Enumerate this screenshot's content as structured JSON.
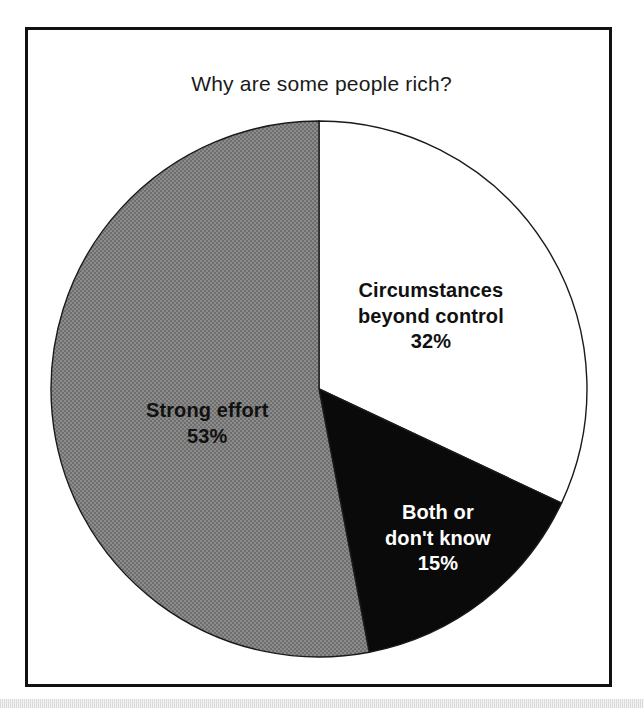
{
  "figure": {
    "title": "Why are some people rich?"
  },
  "chart_data": {
    "type": "pie",
    "title": "Why are some people rich?",
    "xlabel": "",
    "ylabel": "",
    "unit": "%",
    "start_angle_deg": 0,
    "direction": "clockwise",
    "legend": "none",
    "grid": false,
    "categories": [
      "Circumstances beyond control",
      "Both or don't know",
      "Strong effort"
    ],
    "values": [
      32,
      15,
      53
    ],
    "slices": [
      {
        "label": "Circumstances beyond control",
        "label_line_1": "Circumstances",
        "label_line_2": "beyond control",
        "value": 32,
        "value_label": "32%",
        "color": "#ffffff",
        "text_color": "#111111",
        "start_angle_deg": 0,
        "end_angle_deg": 115.2
      },
      {
        "label": "Both or don't know",
        "label_line_1": "Both or",
        "label_line_2": "don't know",
        "value": 15,
        "value_label": "15%",
        "color": "#0a0a0a",
        "text_color": "#ffffff",
        "start_angle_deg": 115.2,
        "end_angle_deg": 169.2
      },
      {
        "label": "Strong effort",
        "label_line_1": "Strong effort",
        "label_line_2": "",
        "value": 53,
        "value_label": "53%",
        "color": "#808080",
        "text_color": "#111111",
        "start_angle_deg": 169.2,
        "end_angle_deg": 360
      }
    ]
  },
  "colors": {
    "frame_border": "#111111",
    "background": "#ffffff",
    "slice_white": "#ffffff",
    "slice_black": "#0a0a0a",
    "slice_gray": "#808080",
    "outline": "#1a1a1a"
  }
}
